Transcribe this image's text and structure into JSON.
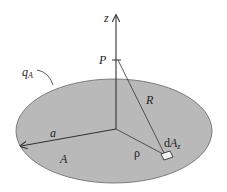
{
  "diagram": {
    "labels": {
      "z_axis": "z",
      "point": "P",
      "charge": "q",
      "charge_sub": "A",
      "distance": "R",
      "radius": "a",
      "area": "A",
      "rho": "ρ",
      "element": "dA",
      "element_sub": "z"
    },
    "colors": {
      "disk_fill": "#b9b9b9",
      "disk_stroke": "#555555",
      "line": "#333333",
      "background": "#ffffff"
    }
  }
}
